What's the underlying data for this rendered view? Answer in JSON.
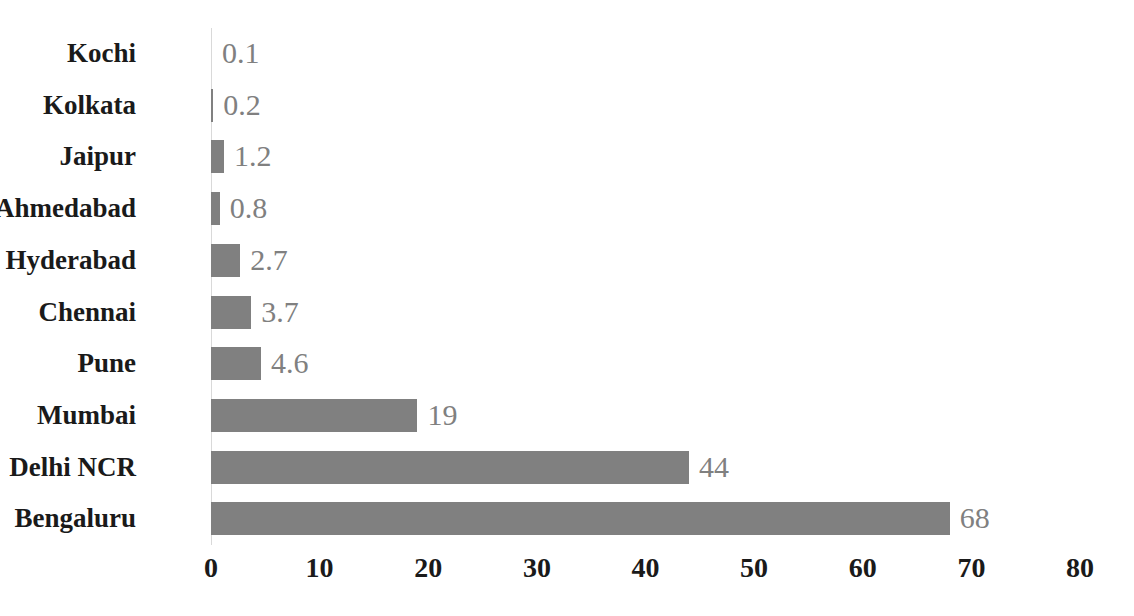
{
  "chart_data": {
    "type": "bar",
    "orientation": "horizontal",
    "title": "",
    "subtitle": "",
    "xlabel": "",
    "ylabel": "",
    "categories": [
      "Kochi",
      "Kolkata",
      "Jaipur",
      "Ahmedabad",
      "Hyderabad",
      "Chennai",
      "Pune",
      "Mumbai",
      "Delhi NCR",
      "Bengaluru"
    ],
    "values": [
      0.1,
      0.2,
      1.2,
      0.8,
      2.7,
      3.7,
      4.6,
      19,
      44,
      68
    ],
    "value_labels": [
      "0.1",
      "0.2",
      "1.2",
      "0.8",
      "2.7",
      "3.7",
      "4.6",
      "19",
      "44",
      "68"
    ],
    "xlim": [
      0,
      80
    ],
    "xticks": [
      0,
      10,
      20,
      30,
      40,
      50,
      60,
      70,
      80
    ],
    "xtick_labels": [
      "0",
      "10",
      "20",
      "30",
      "40",
      "50",
      "60",
      "70",
      "80"
    ],
    "grid": false,
    "legend": false,
    "legend_position": "none",
    "bar_color": "#808080",
    "label_color": "#808080",
    "category_color": "#1a1a1a",
    "axis_color": "#d9d9d9",
    "background": "#ffffff"
  }
}
